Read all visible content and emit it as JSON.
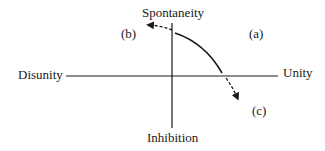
{
  "diagram": {
    "axes": {
      "top": "Spontaneity",
      "bottom": "Inhibition",
      "left": "Disunity",
      "right": "Unity"
    },
    "quadrant_labels": {
      "a": "(a)",
      "b": "(b)",
      "c": "(c)"
    },
    "colors": {
      "ink": "#1a1a1a",
      "background": "#ffffff"
    }
  }
}
